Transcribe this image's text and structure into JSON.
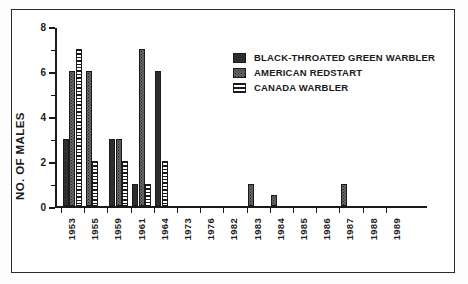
{
  "chart_data": {
    "type": "bar",
    "title": "",
    "xlabel": "",
    "ylabel": "NO. OF MALES",
    "ylim": [
      0,
      8
    ],
    "yticks": [
      0,
      2,
      4,
      6,
      8
    ],
    "yticks_minor": [
      1,
      3,
      5,
      7
    ],
    "grid": false,
    "legend_position": "top-right",
    "categories": [
      "1953",
      "1955",
      "1959",
      "1961",
      "1964",
      "1973",
      "1976",
      "1982",
      "1983",
      "1984",
      "1985",
      "1986",
      "1987",
      "1988",
      "1989"
    ],
    "series": [
      {
        "name": "BLACK-THROATED GREEN WARBLER",
        "pattern": "solid",
        "color": "#2e2e2e",
        "values": [
          3,
          0,
          3,
          1,
          6,
          0,
          0,
          0,
          0,
          0,
          0,
          0,
          0,
          0,
          0
        ]
      },
      {
        "name": "AMERICAN REDSTART",
        "pattern": "stipple",
        "color": "#6a6a6a",
        "values": [
          6,
          6,
          3,
          7,
          0,
          0,
          0,
          0,
          1,
          0.5,
          0,
          0,
          1,
          0,
          0
        ]
      },
      {
        "name": "CANADA WARBLER",
        "pattern": "hstripe",
        "color": "#ffffff",
        "values": [
          7,
          2,
          2,
          1,
          2,
          0,
          0,
          0,
          0,
          0,
          0,
          0,
          0,
          0,
          0
        ]
      }
    ]
  },
  "axis": {
    "y_title": "NO. OF MALES",
    "y_tick_labels": [
      "0",
      "2",
      "4",
      "6",
      "8"
    ]
  },
  "legend": {
    "items": [
      {
        "label": "BLACK-THROATED GREEN WARBLER",
        "pattern": "solid"
      },
      {
        "label": "AMERICAN REDSTART",
        "pattern": "stipple"
      },
      {
        "label": "CANADA WARBLER",
        "pattern": "hstripe"
      }
    ]
  }
}
